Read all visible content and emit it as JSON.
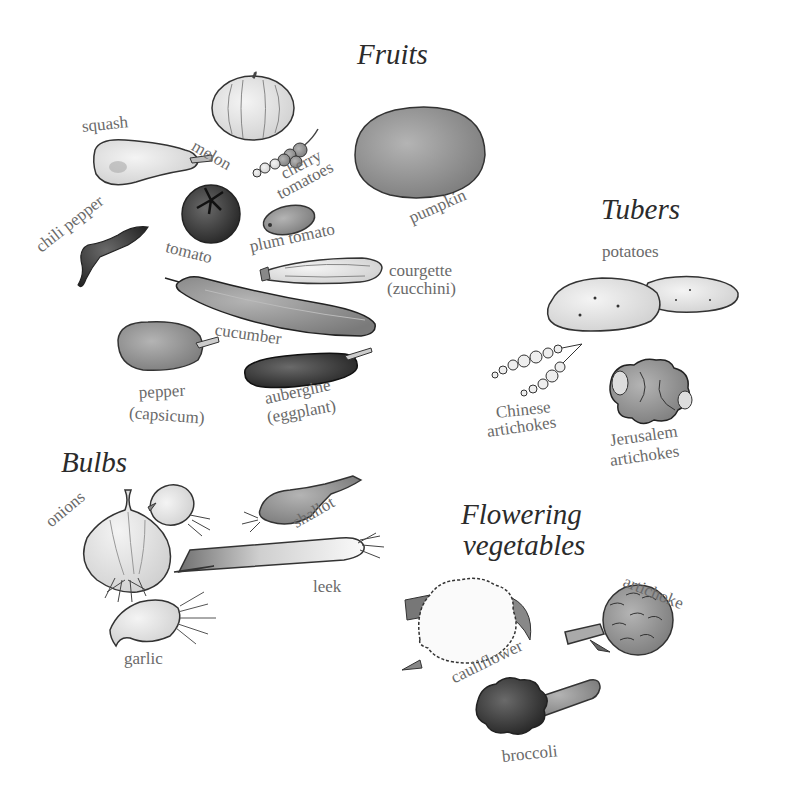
{
  "groups": {
    "fruits": {
      "title": "Fruits",
      "items": {
        "squash": "squash",
        "melon": "melon",
        "cherry_tomatoes_1": "cherry",
        "cherry_tomatoes_2": "tomatoes",
        "pumpkin": "pumpkin",
        "chili_pepper": "chili pepper",
        "tomato": "tomato",
        "plum_tomato": "plum tomato",
        "courgette_1": "courgette",
        "courgette_2": "(zucchini)",
        "cucumber": "cucumber",
        "pepper_1": "pepper",
        "pepper_2": "(capsicum)",
        "aubergine_1": "aubergine",
        "aubergine_2": "(eggplant)"
      }
    },
    "tubers": {
      "title": "Tubers",
      "items": {
        "potatoes": "potatoes",
        "chinese_1": "Chinese",
        "chinese_2": "artichokes",
        "jerusalem_1": "Jerusalem",
        "jerusalem_2": "artichokes"
      }
    },
    "bulbs": {
      "title": "Bulbs",
      "items": {
        "onions": "onions",
        "shallot": "shallot",
        "leek": "leek",
        "garlic": "garlic"
      }
    },
    "flowering": {
      "title_1": "Flowering",
      "title_2": "vegetables",
      "items": {
        "artichoke": "artichoke",
        "cauliflower": "cauliflower",
        "broccoli": "broccoli"
      }
    }
  },
  "colors": {
    "ink": "#2b2b2b",
    "label": "#6a6a6a",
    "fill_light": "#e6e6e6",
    "fill_mid": "#9a9a9a",
    "fill_dark": "#3a3a3a"
  }
}
